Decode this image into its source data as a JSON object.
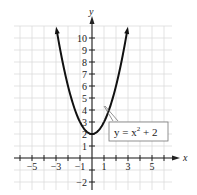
{
  "chart_data": {
    "type": "line",
    "title": "",
    "xlabel": "x",
    "ylabel": "y",
    "xlim": [
      -6,
      6
    ],
    "ylim": [
      -2.5,
      11
    ],
    "grid": true,
    "x_tick_labels": [
      "-5",
      "-3",
      "-1",
      "1",
      "3",
      "5"
    ],
    "x_tick_values": [
      -5,
      -3,
      -1,
      1,
      3,
      5
    ],
    "y_tick_labels": [
      "-2",
      "1",
      "2",
      "3",
      "4",
      "5",
      "6",
      "7",
      "8",
      "9",
      "10"
    ],
    "y_tick_values": [
      -2,
      1,
      2,
      3,
      4,
      5,
      6,
      7,
      8,
      9,
      10
    ],
    "series": [
      {
        "name": "y = x^2 + 2",
        "function": "x^2 + 2",
        "x": [
          -3,
          -2,
          -1,
          0,
          1,
          2,
          3
        ],
        "y": [
          11,
          6,
          3,
          2,
          3,
          6,
          11
        ]
      }
    ],
    "annotations": [
      {
        "text_base": "y = x",
        "superscript": "2",
        "text_tail": " + 2",
        "points_to": [
          1.6,
          4.6
        ]
      }
    ],
    "colors": {
      "curve": "#111111",
      "grid": "#dcdcdc",
      "axis": "#222222"
    }
  }
}
